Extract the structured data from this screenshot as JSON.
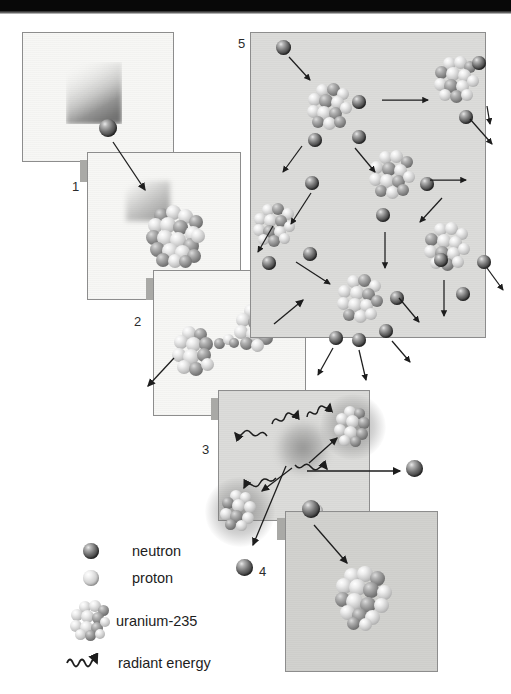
{
  "figure": {
    "type": "diagram",
    "panel_count": 6,
    "numbered_labels": [
      "1",
      "2",
      "3",
      "4",
      "5"
    ]
  },
  "panels": [
    {
      "id": "panel-1",
      "number": "1",
      "caption": "",
      "description": "A neutron travels with a motion trail toward a target",
      "background": "#f7f7f5",
      "contents": {
        "neutrons": 1,
        "protons": 0,
        "nuclei": 0,
        "arrows": 0,
        "radiant_energy": 0
      }
    },
    {
      "id": "panel-2",
      "number": "2",
      "caption": "",
      "description": "The neutron strikes and is absorbed by a uranium-235 nucleus",
      "background": "#f7f7f5",
      "contents": {
        "neutrons": 0,
        "protons": 0,
        "nuclei": 1,
        "arrows": 1,
        "radiant_energy": 0
      }
    },
    {
      "id": "panel-3",
      "number": "3",
      "caption": "",
      "description": "The unstable nucleus elongates and necks into two lobes",
      "background": "#f7f7f5",
      "contents": {
        "neutrons": 0,
        "protons": 0,
        "nuclei": 2,
        "arrows": 2,
        "radiant_energy": 0
      }
    },
    {
      "id": "panel-4",
      "number": "4",
      "caption": "",
      "description": "The nucleus splits; two fission fragments, free neutrons and radiant energy fly apart",
      "background": "#dcdcda",
      "contents": {
        "neutrons": 3,
        "protons": 1,
        "nuclei": 2,
        "arrows": 6,
        "radiant_energy": 5
      }
    },
    {
      "id": "panel-5",
      "number": "5",
      "caption": "",
      "description": "Chain reaction: released neutrons strike further uranium-235 nuclei",
      "background": "#dcdcda",
      "contents": {
        "neutrons": 14,
        "protons": 0,
        "nuclei": 5,
        "arrows": 13,
        "radiant_energy": 0
      }
    },
    {
      "id": "panel-6",
      "number": "",
      "caption": "",
      "description": "A freed neutron arrives at a new uranium-235 nucleus",
      "background": "#d2d2cf",
      "contents": {
        "neutrons": 1,
        "protons": 0,
        "nuclei": 1,
        "arrows": 1,
        "radiant_energy": 0
      }
    }
  ],
  "legend": {
    "title": "",
    "items": [
      {
        "symbol": "neutron-icon",
        "label": "neutron",
        "color": "#4a4a4a"
      },
      {
        "symbol": "proton-icon",
        "label": "proton",
        "color": "#cfcfcf"
      },
      {
        "symbol": "uranium-235-icon",
        "label": "uranium-235",
        "color": "#b4b4b4"
      },
      {
        "symbol": "radiant-energy-icon",
        "label": "radiant energy",
        "color": "#222222"
      }
    ]
  },
  "colors": {
    "page_background": "#ffffff",
    "scan_bar": "#080808",
    "panel_border": "#8d8d8d",
    "panel_light": "#f7f7f5",
    "panel_grey": "#dcdcda",
    "ink": "#1a1a1a"
  }
}
